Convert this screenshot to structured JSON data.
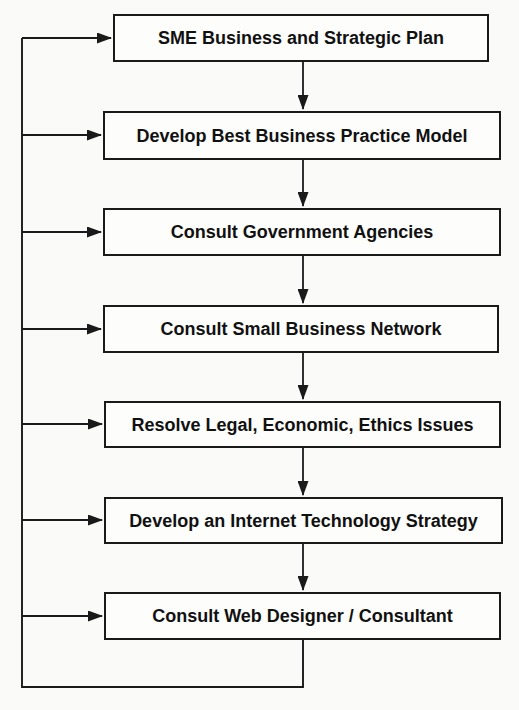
{
  "diagram": {
    "type": "flowchart",
    "boxes": [
      {
        "label": "SME Business and Strategic Plan"
      },
      {
        "label": "Develop Best Business Practice Model"
      },
      {
        "label": "Consult Government Agencies"
      },
      {
        "label": "Consult Small Business Network"
      },
      {
        "label": "Resolve Legal, Economic, Ethics Issues"
      },
      {
        "label": "Develop an Internet Technology Strategy"
      },
      {
        "label": "Consult Web Designer / Consultant"
      }
    ],
    "flow": [
      "SME Business and Strategic Plan -> Develop Best Business Practice Model",
      "Develop Best Business Practice Model -> Consult Government Agencies",
      "Consult Government Agencies -> Consult Small Business Network",
      "Consult Small Business Network -> Resolve Legal, Economic, Ethics Issues",
      "Resolve Legal, Economic, Ethics Issues -> Develop an Internet Technology Strategy",
      "Develop an Internet Technology Strategy -> Consult Web Designer / Consultant",
      "Consult Web Designer / Consultant -> feedback loop into every box"
    ],
    "colors": {
      "line": "#1a1a1a",
      "box_border": "#1a1a1a",
      "box_fill": "#fdfdfc",
      "background": "#fafaf8",
      "text": "#111111"
    }
  }
}
